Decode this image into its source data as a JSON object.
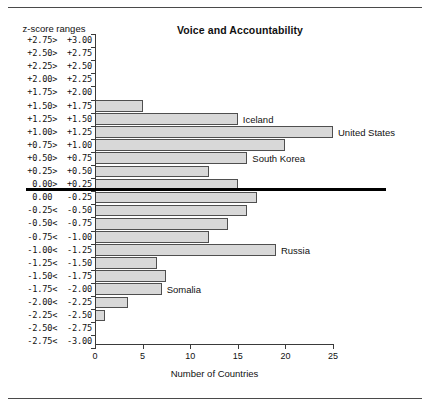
{
  "chart_data": {
    "type": "bar",
    "orientation": "horizontal",
    "title": "Voice and Accountability",
    "xlabel": "Number of Countries",
    "ylabel": "z-score ranges",
    "xlim": [
      0,
      25
    ],
    "xticks": [
      "0",
      "5",
      "10",
      "15",
      "20",
      "25"
    ],
    "xtick_values": [
      0,
      5,
      10,
      15,
      20,
      25
    ],
    "grid": false,
    "legend": null,
    "categories": [
      "+2.75>  +3.00",
      "+2.50>  +2.75",
      "+2.25>  +2.50",
      "+2.00>  +2.25",
      "+1.75>  +2.00",
      "+1.50>  +1.75",
      "+1.25>  +1.50",
      "+1.00>  +1.25",
      "+0.75>  +1.00",
      "+0.50>  +0.75",
      "+0.25>  +0.50",
      " 0.00>  +0.25",
      " 0.00   -0.25",
      "-0.25<  -0.50",
      "-0.50<  -0.75",
      "-0.75<  -1.00",
      "-1.00<  -1.25",
      "-1.25<  -1.50",
      "-1.50<  -1.75",
      "-1.75<  -2.00",
      "-2.00<  -2.25",
      "-2.25<  -2.50",
      "-2.50<  -2.75",
      "-2.75<  -3.00"
    ],
    "values": [
      0,
      0,
      0,
      0,
      0,
      5,
      15,
      25,
      20,
      16,
      12,
      15,
      17,
      16,
      14,
      12,
      19,
      6.5,
      7.5,
      7,
      3.5,
      1,
      0,
      0
    ],
    "annotations": [
      {
        "label": "Iceland",
        "category": "+1.25>  +1.50"
      },
      {
        "label": "United States",
        "category": "+1.00>  +1.25"
      },
      {
        "label": "South Korea",
        "category": "+0.50>  +0.75"
      },
      {
        "label": "Russia",
        "category": "-1.00<  -1.25"
      },
      {
        "label": "Somalia",
        "category": "-1.75<  -2.00"
      }
    ]
  },
  "chart": {
    "title": "Voice and Accountability",
    "y_header": "z-score ranges",
    "x_title": "Number of Countries"
  },
  "annotations": {
    "iceland": "Iceland",
    "united_states": "United States",
    "south_korea": "South Korea",
    "russia": "Russia",
    "somalia": "Somalia"
  },
  "xticks": {
    "t0": "0",
    "t1": "5",
    "t2": "10",
    "t3": "15",
    "t4": "20",
    "t5": "25"
  },
  "rows": [
    {
      "label": "+2.75>  +3.00",
      "value": 0
    },
    {
      "label": "+2.50>  +2.75",
      "value": 0
    },
    {
      "label": "+2.25>  +2.50",
      "value": 0
    },
    {
      "label": "+2.00>  +2.25",
      "value": 0
    },
    {
      "label": "+1.75>  +2.00",
      "value": 0
    },
    {
      "label": "+1.50>  +1.75",
      "value": 5
    },
    {
      "label": "+1.25>  +1.50",
      "value": 15
    },
    {
      "label": "+1.00>  +1.25",
      "value": 25
    },
    {
      "label": "+0.75>  +1.00",
      "value": 20
    },
    {
      "label": "+0.50>  +0.75",
      "value": 16
    },
    {
      "label": "+0.25>  +0.50",
      "value": 12
    },
    {
      "label": " 0.00>  +0.25",
      "value": 15
    },
    {
      "label": " 0.00   -0.25",
      "value": 17
    },
    {
      "label": "-0.25<  -0.50",
      "value": 16
    },
    {
      "label": "-0.50<  -0.75",
      "value": 14
    },
    {
      "label": "-0.75<  -1.00",
      "value": 12
    },
    {
      "label": "-1.00<  -1.25",
      "value": 19
    },
    {
      "label": "-1.25<  -1.50",
      "value": 6.5
    },
    {
      "label": "-1.50<  -1.75",
      "value": 7.5
    },
    {
      "label": "-1.75<  -2.00",
      "value": 7
    },
    {
      "label": "-2.00<  -2.25",
      "value": 3.5
    },
    {
      "label": "-2.25<  -2.50",
      "value": 1
    },
    {
      "label": "-2.50<  -2.75",
      "value": 0
    },
    {
      "label": "-2.75<  -3.00",
      "value": 0
    }
  ]
}
